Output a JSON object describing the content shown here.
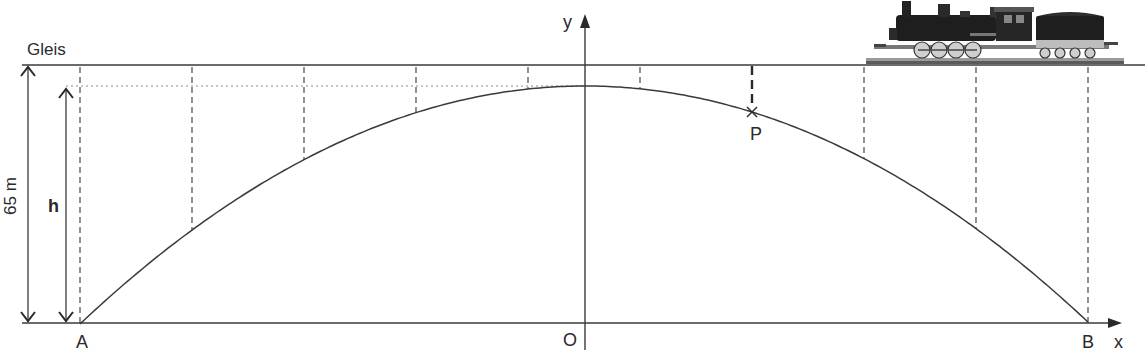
{
  "labels": {
    "track": "Gleis",
    "total_height": "65 m",
    "height_var": "h",
    "point_a": "A",
    "point_b": "B",
    "origin": "O",
    "point_p": "P",
    "axis_x": "x",
    "axis_y": "y"
  },
  "colors": {
    "line": "#3a3a3a",
    "dashed": "#4a4a4a",
    "dotted": "#8a8a8a",
    "text": "#2a2a2a"
  },
  "geometry": {
    "track_y": 65,
    "apex_y": 86,
    "base_y": 323,
    "origin_x": 585,
    "a_x": 80,
    "b_x": 1088,
    "pillars_x": [
      80,
      192,
      304,
      416,
      528,
      640,
      864,
      976,
      1088
    ],
    "p_x": 752
  }
}
